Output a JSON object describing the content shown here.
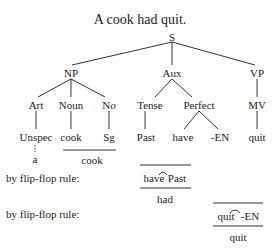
{
  "title": "A cook had quit.",
  "tree": {
    "root": "S",
    "level1": {
      "np": "NP",
      "aux": "Aux",
      "vp": "VP"
    },
    "level2": {
      "art": "Art",
      "noun": "Noun",
      "no_prefix": "N",
      "no_suffix": "o",
      "tense": "Tense",
      "perfect": "Perfect",
      "mv": "MV"
    },
    "level3": {
      "unspec": "Unspec",
      "cook": "cook",
      "sg": "Sg",
      "past": "Past",
      "have": "have",
      "en": "-EN",
      "quit": "quit"
    },
    "level4": {
      "a": "a",
      "cook_combined": "cook"
    }
  },
  "rules": [
    {
      "label": "by flip-flop rule:",
      "input_left": "have",
      "input_right": "Past",
      "output": "had"
    },
    {
      "label": "by flip-flop rule:",
      "input_left": "quit",
      "input_right": "-EN",
      "output": "quit"
    }
  ]
}
